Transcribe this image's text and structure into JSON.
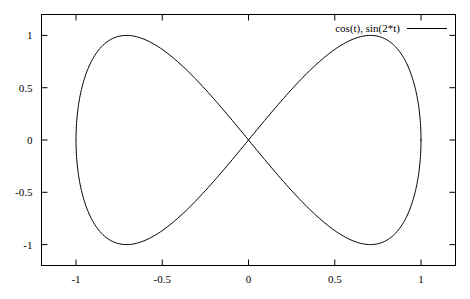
{
  "chart_data": {
    "type": "line",
    "title": "",
    "xlabel": "",
    "ylabel": "",
    "xlim": [
      -1.2,
      1.2
    ],
    "ylim": [
      -1.2,
      1.2
    ],
    "grid": false,
    "legend_position": "top-right-inside",
    "border": "full-box",
    "x_ticks": [
      -1,
      -0.5,
      0,
      0.5,
      1
    ],
    "x_tick_labels": [
      "-1",
      "-0.5",
      "0",
      "0.5",
      "1"
    ],
    "y_ticks": [
      1,
      0.5,
      0,
      -0.5,
      -1
    ],
    "y_tick_labels": [
      "1",
      "0.5",
      "0",
      "-0.5",
      "-1"
    ],
    "series": [
      {
        "name": "cos(t), sin(2*t)",
        "color": "#000000",
        "line_width": 1,
        "parametric": true,
        "t_range": [
          0,
          6.283185307179586
        ],
        "x_expr": "cos(t)",
        "y_expr": "sin(2*t)",
        "samples": 400,
        "key_points": [
          {
            "label": "center-crossing",
            "x": 0,
            "y": 0
          },
          {
            "label": "left-max",
            "x": -0.7071,
            "y": 1
          },
          {
            "label": "left-min",
            "x": -0.7071,
            "y": -1
          },
          {
            "label": "right-max",
            "x": 0.7071,
            "y": 1
          },
          {
            "label": "right-min",
            "x": 0.7071,
            "y": -1
          },
          {
            "label": "left-extent",
            "x": -1,
            "y": 0
          },
          {
            "label": "right-extent",
            "x": 1,
            "y": 0
          }
        ]
      }
    ]
  },
  "legend": {
    "entries": [
      {
        "label": "cos(t), sin(2*t)",
        "color": "#000000"
      }
    ]
  },
  "axes": {
    "x_tick_labels": [
      "-1",
      "-0.5",
      "0",
      "0.5",
      "1"
    ],
    "y_tick_labels": [
      "1",
      "0.5",
      "0",
      "-0.5",
      "-1"
    ]
  }
}
